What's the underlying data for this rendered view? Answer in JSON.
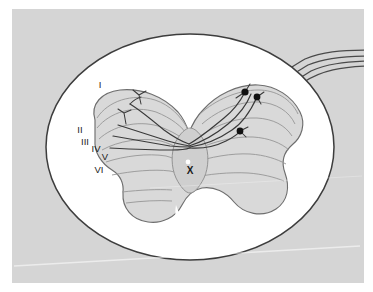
{
  "figure": {
    "caption": "",
    "background_color": "#d5d5d5",
    "plate_border_color": "#ffffff",
    "white_matter_color": "#ffffff",
    "gray_matter_color": "#d9d9d9",
    "outline_color": "#4a4a4a",
    "lamina_line_color": "#8f8f8f",
    "neuron_color": "#111111",
    "fiber_color": "#4a4a4a",
    "canal_color": "#ffffff"
  },
  "labels": {
    "laminae": [
      {
        "id": "lamina-1",
        "text": "I",
        "x": 100,
        "y": 88
      },
      {
        "id": "lamina-2",
        "text": "II",
        "x": 80,
        "y": 133
      },
      {
        "id": "lamina-3",
        "text": "III",
        "x": 85,
        "y": 145
      },
      {
        "id": "lamina-4",
        "text": "IV",
        "x": 96,
        "y": 152
      },
      {
        "id": "lamina-5",
        "text": "V",
        "x": 105,
        "y": 160
      },
      {
        "id": "lamina-6",
        "text": "VI",
        "x": 99,
        "y": 173
      }
    ],
    "central": {
      "id": "lamina-10",
      "text": "X",
      "x": 190,
      "y": 174
    }
  },
  "neurons": [
    {
      "id": "neuron-1",
      "cx": 245,
      "cy": 92,
      "r": 3.6
    },
    {
      "id": "neuron-2",
      "cx": 257,
      "cy": 97,
      "r": 3.4
    },
    {
      "id": "neuron-3",
      "cx": 240,
      "cy": 131,
      "r": 3.4
    }
  ],
  "central_canal": {
    "cx": 188,
    "cy": 162,
    "r": 2.4
  },
  "fiber_tract": {
    "count": 4,
    "exit_edge": "right",
    "description": "Four axon fibers exit dorsolaterally toward the right margin"
  },
  "annotations": {
    "scan_artifact": "faint diagonal light streak across lower portion"
  }
}
